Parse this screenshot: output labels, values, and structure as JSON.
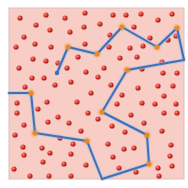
{
  "board": {
    "x": 9,
    "y": 8,
    "width": 175,
    "height": 171,
    "background": "#f8cdc5",
    "border": "#d9c0bb"
  },
  "colors": {
    "dot": "#d9302a",
    "dot_highlight": "#ff8a80",
    "dot_shadow": "#8e1b16",
    "path": "#3f6fb4",
    "path_glow": "#a9c0dd",
    "vertex": "#e8892a"
  },
  "path": {
    "points": [
      [
        9,
        93
      ],
      [
        31,
        93
      ],
      [
        35,
        133
      ],
      [
        87,
        141
      ],
      [
        102,
        179
      ],
      [
        149,
        164
      ],
      [
        147,
        135
      ],
      [
        102,
        112
      ],
      [
        127,
        70
      ],
      [
        184,
        60
      ],
      [
        177,
        28
      ],
      [
        157,
        47
      ],
      [
        122,
        27
      ],
      [
        97,
        54
      ],
      [
        68,
        47
      ],
      [
        57,
        73
      ]
    ],
    "vertices": [
      [
        31,
        93
      ],
      [
        35,
        133
      ],
      [
        87,
        141
      ],
      [
        149,
        164
      ],
      [
        147,
        135
      ],
      [
        102,
        112
      ],
      [
        127,
        70
      ],
      [
        177,
        28
      ],
      [
        157,
        47
      ],
      [
        122,
        27
      ],
      [
        97,
        54
      ],
      [
        68,
        47
      ]
    ],
    "end": [
      57,
      73
    ]
  },
  "dots": [
    [
      20,
      18
    ],
    [
      46,
      15
    ],
    [
      65,
      18
    ],
    [
      85,
      13
    ],
    [
      113,
      15
    ],
    [
      126,
      15
    ],
    [
      141,
      14
    ],
    [
      172,
      14
    ],
    [
      36,
      25
    ],
    [
      84,
      27
    ],
    [
      100,
      24
    ],
    [
      134,
      27
    ],
    [
      158,
      20
    ],
    [
      24,
      37
    ],
    [
      50,
      30
    ],
    [
      70,
      32
    ],
    [
      110,
      35
    ],
    [
      150,
      38
    ],
    [
      176,
      36
    ],
    [
      16,
      47
    ],
    [
      35,
      44
    ],
    [
      51,
      47
    ],
    [
      85,
      44
    ],
    [
      109,
      47
    ],
    [
      130,
      48
    ],
    [
      143,
      46
    ],
    [
      168,
      40
    ],
    [
      33,
      59
    ],
    [
      46,
      61
    ],
    [
      78,
      57
    ],
    [
      58,
      63
    ],
    [
      120,
      58
    ],
    [
      137,
      57
    ],
    [
      162,
      62
    ],
    [
      19,
      68
    ],
    [
      67,
      68
    ],
    [
      86,
      72
    ],
    [
      104,
      68
    ],
    [
      142,
      69
    ],
    [
      163,
      73
    ],
    [
      177,
      73
    ],
    [
      32,
      78
    ],
    [
      44,
      78
    ],
    [
      71,
      82
    ],
    [
      98,
      77
    ],
    [
      111,
      85
    ],
    [
      138,
      88
    ],
    [
      158,
      86
    ],
    [
      173,
      86
    ],
    [
      25,
      87
    ],
    [
      55,
      85
    ],
    [
      91,
      93
    ],
    [
      122,
      95
    ],
    [
      142,
      103
    ],
    [
      164,
      96
    ],
    [
      17,
      103
    ],
    [
      47,
      102
    ],
    [
      77,
      102
    ],
    [
      117,
      104
    ],
    [
      155,
      104
    ],
    [
      176,
      104
    ],
    [
      38,
      109
    ],
    [
      58,
      117
    ],
    [
      88,
      113
    ],
    [
      131,
      115
    ],
    [
      164,
      113
    ],
    [
      17,
      113
    ],
    [
      24,
      125
    ],
    [
      48,
      122
    ],
    [
      69,
      123
    ],
    [
      98,
      119
    ],
    [
      144,
      123
    ],
    [
      177,
      113
    ],
    [
      15,
      135
    ],
    [
      60,
      138
    ],
    [
      81,
      131
    ],
    [
      112,
      126
    ],
    [
      125,
      132
    ],
    [
      162,
      131
    ],
    [
      23,
      147
    ],
    [
      42,
      148
    ],
    [
      73,
      144
    ],
    [
      108,
      144
    ],
    [
      134,
      148
    ],
    [
      171,
      145
    ],
    [
      24,
      155
    ],
    [
      50,
      153
    ],
    [
      71,
      154
    ],
    [
      113,
      157
    ],
    [
      124,
      149
    ],
    [
      170,
      156
    ],
    [
      14,
      169
    ],
    [
      43,
      162
    ],
    [
      64,
      164
    ],
    [
      86,
      165
    ],
    [
      119,
      168
    ],
    [
      136,
      172
    ],
    [
      158,
      168
    ],
    [
      172,
      166
    ],
    [
      30,
      176
    ],
    [
      49,
      176
    ],
    [
      71,
      176
    ],
    [
      96,
      184
    ],
    [
      159,
      176
    ]
  ]
}
